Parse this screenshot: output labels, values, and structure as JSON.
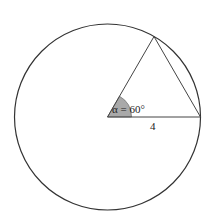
{
  "diagram": {
    "type": "circle-with-inscribed-triangle",
    "circle": {
      "cx": 107.5,
      "cy": 117,
      "r": 93,
      "stroke": "#333333"
    },
    "center": {
      "x": 107.5,
      "y": 117
    },
    "radius_end": {
      "x": 200.5,
      "y": 117
    },
    "top_vertex": {
      "x": 154,
      "y": 36.5
    },
    "angle": {
      "label": "α = 60°",
      "degrees": 60,
      "fill": "#a9a9a9",
      "sector_radius": 24
    },
    "radius_label": "4"
  }
}
